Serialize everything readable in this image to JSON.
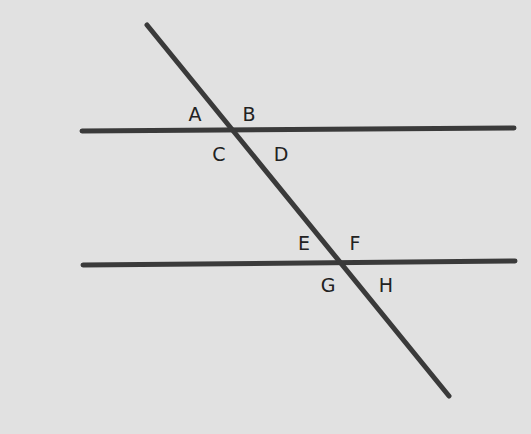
{
  "diagram": {
    "colors": {
      "background": "#e1e1e1",
      "line": "#3a3a3a",
      "label": "#222222"
    },
    "lines": {
      "parallel_top": {
        "x1": 82,
        "y1": 131,
        "x2": 514,
        "y2": 128
      },
      "parallel_bottom": {
        "x1": 83,
        "y1": 265,
        "x2": 515,
        "y2": 261
      },
      "transversal": {
        "x1": 147,
        "y1": 25,
        "x2": 449,
        "y2": 396
      }
    },
    "labels": [
      {
        "id": "A",
        "text": "A",
        "x": 195,
        "y": 114
      },
      {
        "id": "B",
        "text": "B",
        "x": 249,
        "y": 114
      },
      {
        "id": "C",
        "text": "C",
        "x": 219,
        "y": 154
      },
      {
        "id": "D",
        "text": "D",
        "x": 281,
        "y": 154
      },
      {
        "id": "E",
        "text": "E",
        "x": 304,
        "y": 243
      },
      {
        "id": "F",
        "text": "F",
        "x": 355,
        "y": 243
      },
      {
        "id": "G",
        "text": "G",
        "x": 328,
        "y": 285
      },
      {
        "id": "H",
        "text": "H",
        "x": 386,
        "y": 285
      }
    ]
  }
}
